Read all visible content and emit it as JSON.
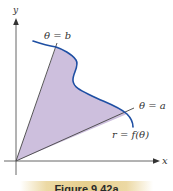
{
  "diagram": {
    "axes": {
      "x_label": "x",
      "y_label": "y",
      "axis_color": "#555555"
    },
    "labels": {
      "theta_b": "θ = b",
      "theta_a": "θ = a",
      "curve": "r = f(θ)"
    },
    "colors": {
      "region_fill": "#cdbfdd",
      "curve": "#1e4fa3",
      "ray": "#444444",
      "caption_band": "#e6cf8e"
    },
    "caption": "Figure 9.42a"
  }
}
